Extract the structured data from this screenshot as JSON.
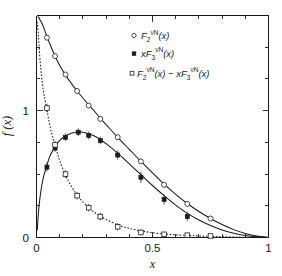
{
  "chart_data": {
    "type": "line",
    "title": "",
    "subtitle": "",
    "xlabel": "x",
    "ylabel": "f (x)",
    "xlim": [
      0,
      1
    ],
    "ylim": [
      0,
      1.75
    ],
    "grid": false,
    "legend_position": "top-right",
    "xticks_major": [
      0,
      0.5,
      1
    ],
    "xtick_labels": [
      "0",
      "0.5",
      "1"
    ],
    "xticks_minor": [
      0.1,
      0.2,
      0.3,
      0.4,
      0.6,
      0.7,
      0.8,
      0.9
    ],
    "yticks_major": [
      0,
      1
    ],
    "ytick_labels": [
      "0",
      "1"
    ],
    "yticks_minor": [
      0.25,
      0.5,
      0.75,
      1.25,
      1.5
    ],
    "legend": [
      {
        "id": "f2",
        "marker": "open-circle",
        "label_main": "F",
        "label_sub": "2",
        "label_sup": "νN",
        "label_arg": "(x)",
        "label_plain": "F2^νN (x)"
      },
      {
        "id": "xf3",
        "marker": "filled-square",
        "label_prefix": "x",
        "label_main": "F",
        "label_sub": "3",
        "label_sup": "νN",
        "label_arg": "(x)",
        "label_plain": "xF3^νN (x)"
      },
      {
        "id": "diff",
        "marker": "open-square",
        "label_plain": "F2^νN (x) − xF3^νN (x)"
      }
    ],
    "series": [
      {
        "name": "F2^νN (x)",
        "marker": "open-circle",
        "linestyle": "solid",
        "points": [
          {
            "x": 0.045,
            "y": 1.575,
            "yerr": 0.02
          },
          {
            "x": 0.08,
            "y": 1.43,
            "yerr": 0.02
          },
          {
            "x": 0.125,
            "y": 1.285,
            "yerr": 0.02
          },
          {
            "x": 0.175,
            "y": 1.155,
            "yerr": 0.02
          },
          {
            "x": 0.225,
            "y": 1.04,
            "yerr": 0.02
          },
          {
            "x": 0.275,
            "y": 0.935,
            "yerr": 0.02
          },
          {
            "x": 0.35,
            "y": 0.79,
            "yerr": 0.02
          },
          {
            "x": 0.45,
            "y": 0.6,
            "yerr": 0.02
          },
          {
            "x": 0.55,
            "y": 0.415,
            "yerr": 0.02
          },
          {
            "x": 0.65,
            "y": 0.265,
            "yerr": 0.02
          },
          {
            "x": 0.75,
            "y": 0.15,
            "yerr": 0.02
          }
        ]
      },
      {
        "name": "xF3^νN (x)",
        "marker": "filled-square",
        "linestyle": "solid",
        "points": [
          {
            "x": 0.045,
            "y": 0.555,
            "yerr": 0.035
          },
          {
            "x": 0.08,
            "y": 0.705,
            "yerr": 0.03
          },
          {
            "x": 0.125,
            "y": 0.79,
            "yerr": 0.03
          },
          {
            "x": 0.18,
            "y": 0.83,
            "yerr": 0.03
          },
          {
            "x": 0.225,
            "y": 0.805,
            "yerr": 0.03
          },
          {
            "x": 0.275,
            "y": 0.765,
            "yerr": 0.03
          },
          {
            "x": 0.35,
            "y": 0.65,
            "yerr": 0.035
          },
          {
            "x": 0.45,
            "y": 0.475,
            "yerr": 0.045
          },
          {
            "x": 0.55,
            "y": 0.3,
            "yerr": 0.04
          },
          {
            "x": 0.65,
            "y": 0.165,
            "yerr": 0.035
          }
        ]
      },
      {
        "name": "F2^νN (x) − xF3^νN (x)",
        "marker": "open-square",
        "linestyle": "dotted",
        "points": [
          {
            "x": 0.045,
            "y": 1.02,
            "yerr": 0.035
          },
          {
            "x": 0.08,
            "y": 0.73,
            "yerr": 0.03
          },
          {
            "x": 0.125,
            "y": 0.5,
            "yerr": 0.03
          },
          {
            "x": 0.175,
            "y": 0.33,
            "yerr": 0.03
          },
          {
            "x": 0.225,
            "y": 0.235,
            "yerr": 0.03
          },
          {
            "x": 0.275,
            "y": 0.165,
            "yerr": 0.03
          },
          {
            "x": 0.35,
            "y": 0.085,
            "yerr": 0.03
          },
          {
            "x": 0.45,
            "y": 0.04,
            "yerr": 0.025
          },
          {
            "x": 0.55,
            "y": 0.025,
            "yerr": 0.02
          },
          {
            "x": 0.65,
            "y": 0.018,
            "yerr": 0.02
          },
          {
            "x": 0.75,
            "y": 0.012,
            "yerr": 0.015
          }
        ]
      }
    ],
    "curves": [
      {
        "name": "F2 fit",
        "linestyle": "solid",
        "samples": [
          [
            0.005,
            1.74
          ],
          [
            0.01,
            1.735
          ],
          [
            0.015,
            1.715
          ],
          [
            0.02,
            1.7
          ],
          [
            0.03,
            1.66
          ],
          [
            0.04,
            1.61
          ],
          [
            0.05,
            1.56
          ],
          [
            0.06,
            1.515
          ],
          [
            0.08,
            1.43
          ],
          [
            0.1,
            1.355
          ],
          [
            0.125,
            1.28
          ],
          [
            0.15,
            1.215
          ],
          [
            0.175,
            1.155
          ],
          [
            0.2,
            1.1
          ],
          [
            0.225,
            1.045
          ],
          [
            0.25,
            0.995
          ],
          [
            0.275,
            0.94
          ],
          [
            0.3,
            0.89
          ],
          [
            0.35,
            0.79
          ],
          [
            0.4,
            0.695
          ],
          [
            0.45,
            0.6
          ],
          [
            0.5,
            0.51
          ],
          [
            0.55,
            0.42
          ],
          [
            0.6,
            0.34
          ],
          [
            0.65,
            0.268
          ],
          [
            0.7,
            0.205
          ],
          [
            0.75,
            0.15
          ],
          [
            0.8,
            0.102
          ],
          [
            0.85,
            0.062
          ],
          [
            0.9,
            0.032
          ],
          [
            0.95,
            0.011
          ],
          [
            1.0,
            0.0
          ]
        ]
      },
      {
        "name": "xF3 fit",
        "linestyle": "solid",
        "samples": [
          [
            0.003,
            0.055
          ],
          [
            0.01,
            0.23
          ],
          [
            0.02,
            0.38
          ],
          [
            0.03,
            0.475
          ],
          [
            0.04,
            0.54
          ],
          [
            0.05,
            0.6
          ],
          [
            0.06,
            0.65
          ],
          [
            0.08,
            0.715
          ],
          [
            0.1,
            0.765
          ],
          [
            0.125,
            0.8
          ],
          [
            0.15,
            0.822
          ],
          [
            0.175,
            0.832
          ],
          [
            0.2,
            0.83
          ],
          [
            0.225,
            0.818
          ],
          [
            0.25,
            0.8
          ],
          [
            0.275,
            0.772
          ],
          [
            0.3,
            0.74
          ],
          [
            0.35,
            0.665
          ],
          [
            0.4,
            0.58
          ],
          [
            0.45,
            0.495
          ],
          [
            0.5,
            0.41
          ],
          [
            0.55,
            0.33
          ],
          [
            0.6,
            0.255
          ],
          [
            0.65,
            0.19
          ],
          [
            0.7,
            0.138
          ],
          [
            0.75,
            0.095
          ],
          [
            0.8,
            0.06
          ],
          [
            0.85,
            0.034
          ],
          [
            0.9,
            0.016
          ],
          [
            0.95,
            0.005
          ],
          [
            1.0,
            0.0
          ]
        ]
      },
      {
        "name": "difference fit",
        "linestyle": "dotted",
        "samples": [
          [
            0.003,
            1.7
          ],
          [
            0.008,
            1.6
          ],
          [
            0.012,
            1.48
          ],
          [
            0.018,
            1.34
          ],
          [
            0.025,
            1.22
          ],
          [
            0.032,
            1.13
          ],
          [
            0.04,
            1.055
          ],
          [
            0.05,
            0.955
          ],
          [
            0.06,
            0.86
          ],
          [
            0.07,
            0.79
          ],
          [
            0.08,
            0.725
          ],
          [
            0.09,
            0.665
          ],
          [
            0.1,
            0.605
          ],
          [
            0.125,
            0.49
          ],
          [
            0.15,
            0.405
          ],
          [
            0.175,
            0.335
          ],
          [
            0.2,
            0.28
          ],
          [
            0.225,
            0.235
          ],
          [
            0.25,
            0.198
          ],
          [
            0.275,
            0.168
          ],
          [
            0.3,
            0.142
          ],
          [
            0.35,
            0.1
          ],
          [
            0.4,
            0.072
          ],
          [
            0.45,
            0.052
          ],
          [
            0.5,
            0.038
          ],
          [
            0.55,
            0.028
          ],
          [
            0.6,
            0.021
          ],
          [
            0.65,
            0.016
          ],
          [
            0.7,
            0.012
          ],
          [
            0.75,
            0.009
          ],
          [
            0.8,
            0.006
          ],
          [
            0.85,
            0.004
          ],
          [
            0.9,
            0.002
          ],
          [
            0.95,
            0.001
          ],
          [
            1.0,
            0.0
          ]
        ]
      }
    ]
  }
}
